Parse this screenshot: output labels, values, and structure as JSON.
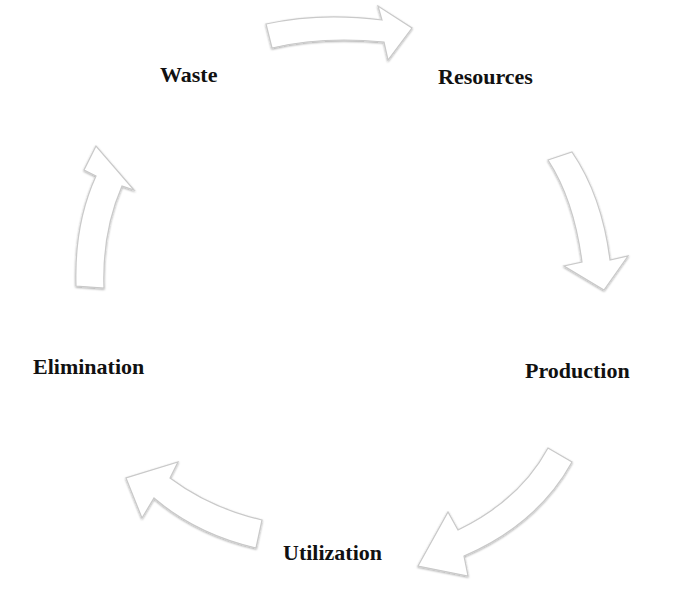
{
  "diagram": {
    "type": "cycle",
    "title": "",
    "nodes": [
      {
        "id": "resources",
        "label": "Resources"
      },
      {
        "id": "production",
        "label": "Production"
      },
      {
        "id": "utilization",
        "label": "Utilization"
      },
      {
        "id": "elimination",
        "label": "Elimination"
      },
      {
        "id": "waste",
        "label": "Waste"
      }
    ],
    "edges": [
      {
        "from": "waste",
        "to": "resources"
      },
      {
        "from": "resources",
        "to": "production"
      },
      {
        "from": "production",
        "to": "utilization"
      },
      {
        "from": "utilization",
        "to": "elimination"
      },
      {
        "from": "elimination",
        "to": "waste"
      }
    ],
    "colors": {
      "background": "#ffffff",
      "arrow_fill": "#ffffff",
      "arrow_outline": "#c9c9c9",
      "text": "#111111"
    }
  }
}
